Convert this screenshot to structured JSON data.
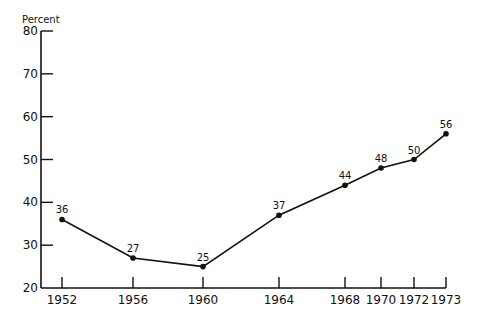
{
  "chart_data": {
    "type": "line",
    "title": "",
    "xlabel": "",
    "ylabel": "Percent",
    "ylim": [
      20,
      80
    ],
    "yticks": [
      20,
      30,
      40,
      50,
      60,
      70,
      80
    ],
    "x": [
      "1952",
      "1956",
      "1960",
      "1964",
      "1968",
      "1970",
      "1972",
      "1973"
    ],
    "series": [
      {
        "name": "Percent",
        "values": [
          36,
          27,
          25,
          37,
          44,
          48,
          50,
          56
        ],
        "data_labels": [
          "36",
          "27",
          "25",
          "37",
          "44",
          "48",
          "50",
          "56"
        ]
      }
    ],
    "grid": false,
    "legend": null
  },
  "layout": {
    "x_positions": [
      62,
      133,
      203,
      279,
      345,
      381,
      414,
      446
    ],
    "y_at_20": 288,
    "y_at_80": 31,
    "axis_x": 41,
    "axis_end_x": 446,
    "line_color": "#111111"
  }
}
